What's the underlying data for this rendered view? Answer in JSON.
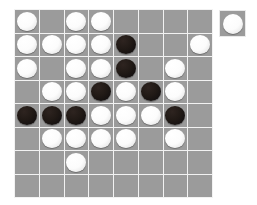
{
  "app": {
    "title": "Othello Board",
    "background_color": "#ffffff"
  },
  "board": {
    "name": "othello-board",
    "rows": 8,
    "columns": 8,
    "cell_color": "#9b9b9b",
    "gridline_color": "#f2f2f2",
    "white_disc_color": "#fcfcfc",
    "black_disc_color": "#1a1412",
    "column_labels": [
      "1",
      "2",
      "3",
      "4",
      "5",
      "6",
      "7",
      "8"
    ],
    "row_labels": [
      "1",
      "2",
      "3",
      "4",
      "5",
      "6",
      "7",
      "8"
    ],
    "cells": [
      [
        "white",
        "empty",
        "white",
        "white",
        "empty",
        "empty",
        "empty",
        "empty"
      ],
      [
        "white",
        "white",
        "white",
        "white",
        "black",
        "empty",
        "empty",
        "white"
      ],
      [
        "white",
        "empty",
        "white",
        "white",
        "black",
        "empty",
        "white",
        "empty"
      ],
      [
        "empty",
        "white",
        "white",
        "black",
        "white",
        "black",
        "white",
        "empty"
      ],
      [
        "black",
        "black",
        "black",
        "white",
        "white",
        "white",
        "black",
        "empty"
      ],
      [
        "empty",
        "white",
        "white",
        "white",
        "white",
        "empty",
        "white",
        "empty"
      ],
      [
        "empty",
        "empty",
        "white",
        "empty",
        "empty",
        "empty",
        "empty",
        "empty"
      ],
      [
        "empty",
        "empty",
        "empty",
        "empty",
        "empty",
        "empty",
        "empty",
        "empty"
      ]
    ]
  },
  "turn_indicator": {
    "name": "current-player-indicator",
    "piece": "white",
    "label": "White to move"
  }
}
